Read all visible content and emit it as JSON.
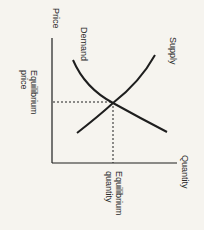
{
  "diagram": {
    "type": "supply-demand",
    "axes": {
      "y_label": "Price",
      "x_label": "Quantity"
    },
    "curves": {
      "demand_label": "Demand",
      "supply_label": "Supply"
    },
    "equilibrium": {
      "price_label_line1": "Equilibrium",
      "price_label_line2": "price",
      "quantity_label_line1": "Equilibrium",
      "quantity_label_line2": "quantity"
    },
    "colors": {
      "background": "#f6f4ef",
      "line": "#1e1e1e",
      "text": "#2a2a2a"
    }
  }
}
